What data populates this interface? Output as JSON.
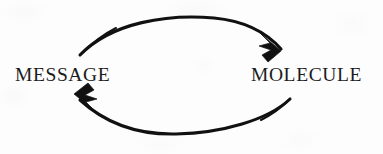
{
  "figure": {
    "kind": "cycle-diagram",
    "width": 383,
    "height": 154,
    "background_color": "#fdfdfd",
    "ink_color": "#111111",
    "node_count": 2,
    "arrow_count": 2
  },
  "nodes": [
    {
      "id": "message",
      "label": "MESSAGE",
      "position": "left",
      "text_color": "#1b1b1b"
    },
    {
      "id": "molecule",
      "label": "MOLECULE",
      "position": "right",
      "text_color": "#1b1b1b"
    }
  ],
  "arrows": [
    {
      "id": "message-to-molecule",
      "name": "top-arrow",
      "direction": "left-to-right",
      "from": "MESSAGE",
      "to": "MOLECULE",
      "curve": "arc-over-top",
      "arrowhead": "barbed",
      "stroke_color": "#111111",
      "path": "M 80 55 C 112 22, 168 14, 214 18 C 246 21, 266 32, 281 49",
      "head_points": "281,51 260,33 270,43 259,46 271,50 262,55 268,62"
    },
    {
      "id": "molecule-to-message",
      "name": "bottom-arrow",
      "direction": "right-to-left",
      "from": "MOLECULE",
      "to": "MESSAGE",
      "curve": "arc-under-bottom",
      "arrowhead": "barbed",
      "stroke_color": "#111111",
      "path": "M 290 99 C 268 120, 222 133, 176 134 C 134 135, 104 122, 80 100",
      "head_points": "74,94 96,112 86,102 97,99 85,95 94,90 88,83"
    }
  ],
  "semantics": {
    "relationship": "bidirectional",
    "reading": "MESSAGE and MOLECULE convert into one another in a closed cycle"
  }
}
